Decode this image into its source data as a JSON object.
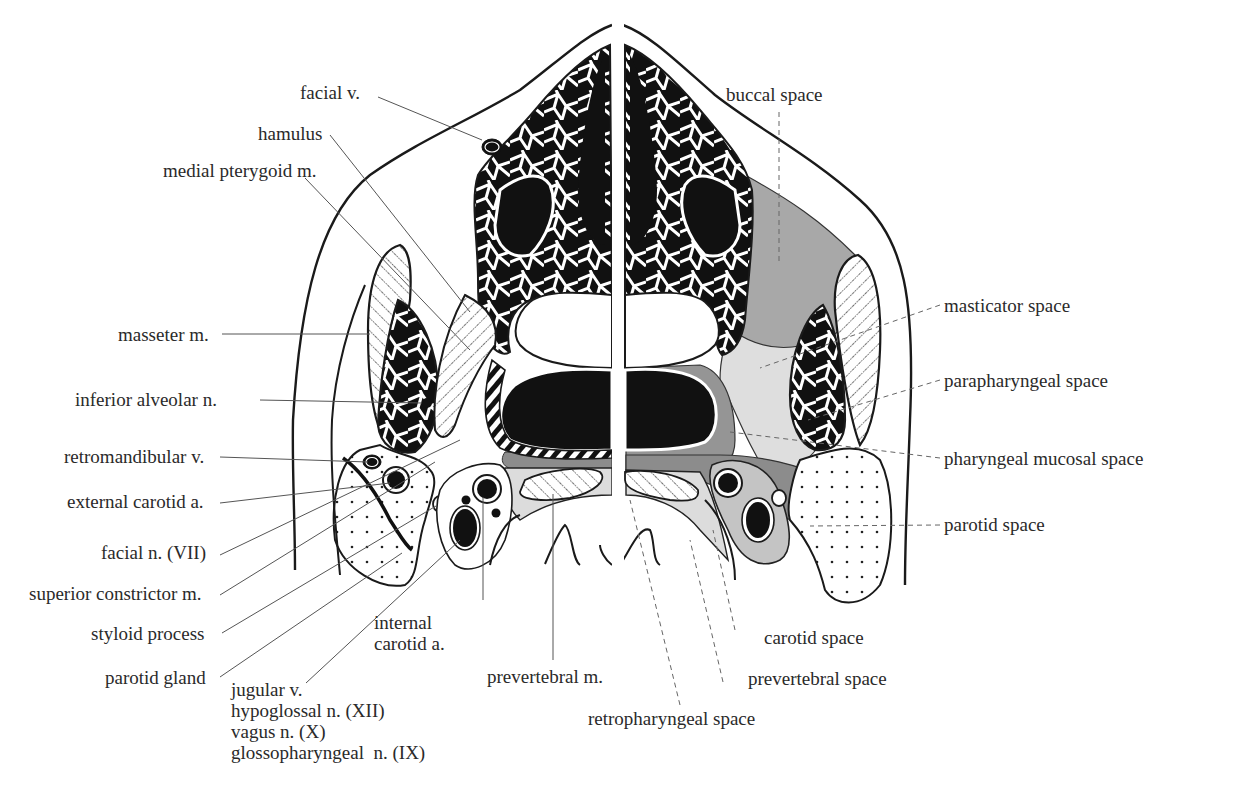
{
  "diagram": {
    "colors": {
      "bone_black": "#111111",
      "outline": "#1a1a1a",
      "buccal_masticator_gray": "#a6a6a6",
      "parapharyngeal_light": "#dedede",
      "mucosal_mid": "#8c8c8c",
      "carotid_space_gray": "#c4c4c4",
      "leader": "#555555"
    },
    "left_labels": [
      {
        "id": "facial-v",
        "text": "facial v."
      },
      {
        "id": "hamulus",
        "text": "hamulus"
      },
      {
        "id": "medial-pterygoid",
        "text": "medial pterygoid m."
      },
      {
        "id": "masseter",
        "text": "masseter m."
      },
      {
        "id": "inferior-alveolar",
        "text": "inferior alveolar n."
      },
      {
        "id": "retromandibular",
        "text": "retromandibular v."
      },
      {
        "id": "external-carotid",
        "text": "external carotid a."
      },
      {
        "id": "facial-n",
        "text": "facial n. (VII)"
      },
      {
        "id": "superior-constrictor",
        "text": "superior constrictor m."
      },
      {
        "id": "styloid",
        "text": "styloid process"
      },
      {
        "id": "parotid-gland",
        "text": "parotid gland"
      }
    ],
    "bottom_labels": {
      "internal_carotid": [
        "internal",
        "carotid a."
      ],
      "prevertebral_m": "prevertebral m.",
      "nerve_stack": [
        "jugular v.",
        "hypoglossal n. (XII)",
        "vagus n. (X)",
        "glossopharyngeal  n. (IX)"
      ],
      "retropharyngeal": "retropharyngeal space",
      "prevertebral_space": "prevertebral space",
      "carotid_space": "carotid space"
    },
    "right_labels": [
      {
        "id": "buccal",
        "text": "buccal space"
      },
      {
        "id": "masticator",
        "text": "masticator space"
      },
      {
        "id": "parapharyngeal",
        "text": "parapharyngeal space"
      },
      {
        "id": "pharyngeal-mucosal",
        "text": "pharyngeal mucosal space"
      },
      {
        "id": "parotid-space",
        "text": "parotid space"
      }
    ],
    "legend_convention": {
      "left_half": "solid leader lines: anatomical structures",
      "right_half": "dashed leader lines: fascial spaces"
    }
  }
}
